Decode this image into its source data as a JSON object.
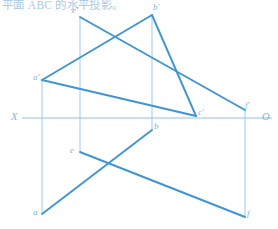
{
  "caption": {
    "text": "平面 ABC 的水平投影。"
  },
  "colors": {
    "line_bold": "#3f95d4",
    "line_thin": "#a8cfee",
    "axis": "#8ec3e8",
    "label": "#7fb4dd",
    "caption": "#9ec4e4",
    "background": "#ffffff"
  },
  "axis": {
    "left_label": "X",
    "right_label": "O",
    "y": 118,
    "x_start": 22,
    "x_end": 272,
    "left_label_x": 11,
    "left_label_y": 112,
    "right_label_x": 262,
    "right_label_y": 112
  },
  "points": [
    {
      "id": "a-prime",
      "label": "a'",
      "x": 42,
      "y": 80,
      "lx": 33,
      "ly": 73,
      "view": "frontal"
    },
    {
      "id": "b-prime",
      "label": "b'",
      "x": 152,
      "y": 15,
      "lx": 153,
      "ly": 3,
      "view": "frontal"
    },
    {
      "id": "c-prime",
      "label": "c'",
      "x": 196,
      "y": 116,
      "lx": 198,
      "ly": 108,
      "view": "frontal"
    },
    {
      "id": "e-prime",
      "label": "e'",
      "x": 80,
      "y": 17,
      "lx": 72,
      "ly": 6,
      "view": "frontal"
    },
    {
      "id": "f-prime",
      "label": "f'",
      "x": 245,
      "y": 110,
      "lx": 245,
      "ly": 101,
      "view": "frontal"
    },
    {
      "id": "a",
      "label": "a",
      "x": 42,
      "y": 214,
      "lx": 33,
      "ly": 208,
      "view": "horizontal"
    },
    {
      "id": "b",
      "label": "b",
      "x": 152,
      "y": 130,
      "lx": 154,
      "ly": 122,
      "view": "horizontal"
    },
    {
      "id": "e",
      "label": "e",
      "x": 80,
      "y": 152,
      "lx": 70,
      "ly": 146,
      "view": "horizontal"
    },
    {
      "id": "f",
      "label": "f",
      "x": 245,
      "y": 217,
      "lx": 247,
      "ly": 209,
      "view": "horizontal"
    }
  ],
  "bold_segments": [
    {
      "id": "seg-ap-bp",
      "from": "a-prime",
      "to": "b-prime",
      "x1": 42,
      "y1": 80,
      "x2": 152,
      "y2": 15
    },
    {
      "id": "seg-bp-cp",
      "from": "b-prime",
      "to": "c-prime",
      "x1": 152,
      "y1": 15,
      "x2": 196,
      "y2": 116
    },
    {
      "id": "seg-ap-cp",
      "from": "a-prime",
      "to": "c-prime",
      "x1": 42,
      "y1": 80,
      "x2": 196,
      "y2": 116
    },
    {
      "id": "seg-ep-fp",
      "from": "e-prime",
      "to": "f-prime",
      "x1": 80,
      "y1": 17,
      "x2": 245,
      "y2": 110
    },
    {
      "id": "seg-a-b",
      "from": "a",
      "to": "b",
      "x1": 42,
      "y1": 214,
      "x2": 152,
      "y2": 130
    },
    {
      "id": "seg-e-f",
      "from": "e",
      "to": "f",
      "x1": 80,
      "y1": 152,
      "x2": 245,
      "y2": 217
    }
  ],
  "projection_lines": [
    {
      "id": "proj-a",
      "x": 42,
      "y1": 80,
      "y2": 214
    },
    {
      "id": "proj-e",
      "x": 80,
      "y1": 17,
      "y2": 152
    },
    {
      "id": "proj-b",
      "x": 152,
      "y1": 15,
      "y2": 130
    },
    {
      "id": "proj-f",
      "x": 245,
      "y1": 110,
      "y2": 217
    }
  ]
}
